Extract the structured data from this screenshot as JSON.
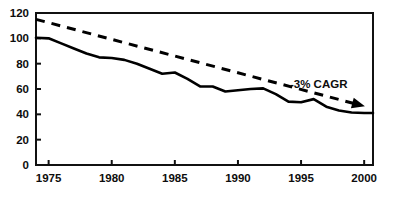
{
  "chart_data": {
    "type": "line",
    "title": "",
    "subtitle": "",
    "xlabel": "",
    "ylabel": "",
    "xlim": [
      1974,
      2000.7
    ],
    "ylim": [
      0,
      120
    ],
    "grid": false,
    "legend": "none",
    "x_ticks": [
      "1975",
      "1980",
      "1985",
      "1990",
      "1995",
      "2000"
    ],
    "x_tick_values": [
      1975,
      1980,
      1985,
      1990,
      1995,
      2000
    ],
    "y_ticks": [
      "0",
      "20",
      "40",
      "60",
      "80",
      "100",
      "120"
    ],
    "y_tick_values": [
      0,
      20,
      40,
      60,
      80,
      100,
      120
    ],
    "series": [
      {
        "name": "actual",
        "style": "solid",
        "color": "#000000",
        "x": [
          1974.0,
          1975.0,
          1976.0,
          1977.0,
          1978.0,
          1979.0,
          1980.0,
          1981.0,
          1982.0,
          1983.0,
          1984.0,
          1985.0,
          1986.0,
          1987.0,
          1988.0,
          1989.0,
          1990.0,
          1991.0,
          1992.0,
          1993.0,
          1994.0,
          1995.0,
          1996.0,
          1997.0,
          1998.0,
          1999.0,
          2000.0,
          2000.7
        ],
        "values": [
          100.5,
          100.0,
          96.0,
          92.0,
          88.0,
          85.0,
          84.5,
          83.0,
          80.0,
          76.0,
          72.0,
          73.0,
          68.0,
          62.0,
          62.0,
          58.0,
          59.0,
          60.0,
          60.5,
          56.0,
          50.0,
          49.5,
          52.0,
          46.0,
          43.0,
          41.5,
          41.0,
          41.0
        ]
      },
      {
        "name": "trend",
        "style": "dashed",
        "color": "#000000",
        "arrow_end": true,
        "x": [
          1974.0,
          1999.6
        ],
        "values": [
          115.0,
          47.5
        ]
      }
    ],
    "annotations": [
      {
        "text": "-3% CAGR",
        "x": 1996.4,
        "y": 61.0,
        "series": "trend"
      }
    ]
  },
  "axes": {
    "frame": "box",
    "tick_direction": "inward"
  }
}
